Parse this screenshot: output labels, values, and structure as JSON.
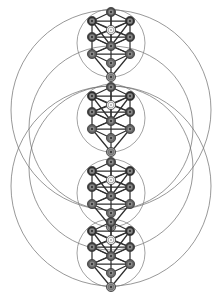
{
  "diagram": {
    "subtitle": "Kabbalistic Otz Chiim, four stacked trees within intersecting circles",
    "type": "esoteric-diagram",
    "background_color": "#ffffff",
    "stroke_color": "#2f2f2f",
    "circle_color": "#6b6b6b",
    "canvas": {
      "width": 222,
      "height": 296
    },
    "worlds": [
      {
        "name": "Atziluth",
        "label": "Atziluth",
        "order": 1,
        "center_y": 43,
        "circle_radius": 34
      },
      {
        "name": "Briah",
        "label": "Briah",
        "order": 2,
        "center_y": 118,
        "circle_radius": 34
      },
      {
        "name": "Yetzirah",
        "label": "Yetzirah",
        "order": 3,
        "center_y": 193,
        "circle_radius": 34
      },
      {
        "name": "Assiah",
        "label": "Assiah",
        "order": 4,
        "center_y": 253,
        "circle_radius": 34
      }
    ],
    "great_circles": [
      {
        "name": "upper-great-circle",
        "cx": 111,
        "cy": 110,
        "r": 100
      },
      {
        "name": "lower-great-circle",
        "cx": 111,
        "cy": 186,
        "r": 100
      },
      {
        "name": "upper-mid-circle",
        "cx": 111,
        "cy": 128,
        "r": 82
      },
      {
        "name": "lower-mid-circle",
        "cx": 111,
        "cy": 168,
        "r": 82
      }
    ],
    "sephirot": [
      {
        "key": "keter",
        "label": "Keter",
        "number": 1,
        "pillar": "middle",
        "shade": "#4a4a4a"
      },
      {
        "key": "chokmah",
        "label": "Chokmah",
        "number": 2,
        "pillar": "right",
        "shade": "#2a2a2a"
      },
      {
        "key": "binah",
        "label": "Binah",
        "number": 3,
        "pillar": "left",
        "shade": "#2a2a2a"
      },
      {
        "key": "daath",
        "label": "Daath",
        "number": 0,
        "pillar": "middle",
        "shade": "#efefef"
      },
      {
        "key": "chesed",
        "label": "Chesed",
        "number": 4,
        "pillar": "right",
        "shade": "#3d3d3d"
      },
      {
        "key": "geburah",
        "label": "Geburah",
        "number": 5,
        "pillar": "left",
        "shade": "#3d3d3d"
      },
      {
        "key": "tiferet",
        "label": "Tiferet",
        "number": 6,
        "pillar": "middle",
        "shade": "#585858"
      },
      {
        "key": "netzach",
        "label": "Netzach",
        "number": 7,
        "pillar": "right",
        "shade": "#5e5e5e"
      },
      {
        "key": "hod",
        "label": "Hod",
        "number": 8,
        "pillar": "left",
        "shade": "#5e5e5e"
      },
      {
        "key": "yesod",
        "label": "Yesod",
        "number": 9,
        "pillar": "middle",
        "shade": "#6a6a6a"
      },
      {
        "key": "malkuth",
        "label": "Malkuth",
        "number": 10,
        "pillar": "middle",
        "shade": "#9a9a9a"
      }
    ],
    "pillars": [
      {
        "name": "pillar-of-severity",
        "label": "Severity",
        "dx": -20
      },
      {
        "name": "pillar-of-mildness",
        "label": "Mildness",
        "dx": 0
      },
      {
        "name": "pillar-of-mercy",
        "label": "Mercy",
        "dx": 20
      }
    ],
    "node_radius": 4.6,
    "path_count": 22,
    "tree_node_count": 11
  }
}
